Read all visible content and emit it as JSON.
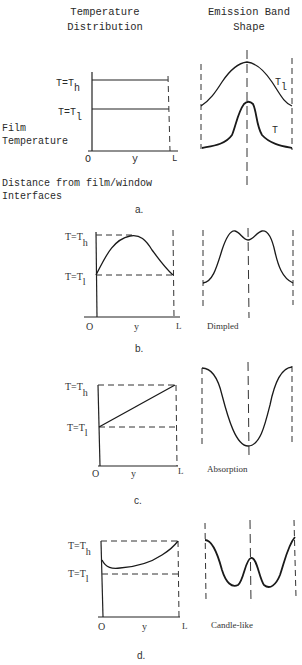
{
  "headers": {
    "left_line1": "Temperature",
    "left_line2": "Distribution",
    "right_line1": "Emission Band",
    "right_line2": "Shape"
  },
  "axis_labels": {
    "origin": "O",
    "position": "y",
    "length": "L",
    "t_high": "T=T",
    "t_high_sub": "h",
    "t_low": "T=T",
    "t_low_sub": "l",
    "film_line1": "Film",
    "film_line2": "Temperature",
    "distance_line1": "Distance from film/window",
    "distance_line2": "Interfaces"
  },
  "panels": [
    {
      "id": "a",
      "caption": "a.",
      "temperature_profile": "isothermal (two constant levels T_h and T_l)",
      "emission_shape": "",
      "curve_labels": {
        "upper_main": "T",
        "upper_sub": "l",
        "lower": "T"
      }
    },
    {
      "id": "b",
      "caption": "b.",
      "temperature_profile": "parabolic, max T_h at center, T_l at both walls",
      "emission_shape": "Dimpled"
    },
    {
      "id": "c",
      "caption": "c.",
      "temperature_profile": "linear, T_l at y=0 rising to T_h at y=L",
      "emission_shape": "Absorption"
    },
    {
      "id": "d",
      "caption": "d.",
      "temperature_profile": "non-monotonic, dip near y=0 then rising to T_h at y=L",
      "emission_shape": "Candle-like"
    }
  ]
}
